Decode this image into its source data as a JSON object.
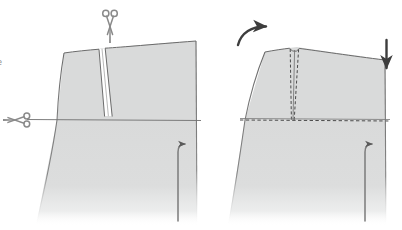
{
  "illustration": {
    "title": "Dart cutting and closing diagram",
    "description": "Two-step garment pattern illustration: left panel shows a skirt/trouser pattern block with an open V dart marked for cutting; right panel shows the same block with the dart stitched closed and arrows indicating fabric rotation and settling.",
    "background_color": "#ffffff",
    "fabric_fill_color": "#d9dada",
    "fabric_fill_color_light": "#e3e4e4",
    "outline_color": "#6b6b6b",
    "stitch_color": "#4a4a4a",
    "icon_color": "#8a8a8a",
    "arrow_color": "#3d3d3d"
  },
  "left_panel": {
    "name": "cut-step",
    "step_number": "1",
    "edge_label": "e",
    "elements": {
      "pattern_piece": "pattern-block-open-dart",
      "dart": "open-v-dart",
      "hip_line": "horizontal-hip-guide-line",
      "scissors_top": "scissors-icon-vertical",
      "scissors_left": "scissors-icon-horizontal",
      "side_seam_arrow": "hook-arrow-up-right"
    },
    "scissors_top_rotation_deg": "0",
    "scissors_left_rotation_deg": "90"
  },
  "right_panel": {
    "name": "sewn-step",
    "step_number": "2",
    "elements": {
      "pattern_piece": "pattern-block-closed-dart",
      "dart_stitch_left": "dart-stitch-line-left",
      "dart_stitch_right": "dart-stitch-line-right",
      "hip_line": "horizontal-hip-stitch-line",
      "rotate_arrow": "curved-arrow-rotate-up-right",
      "drop_arrow": "straight-arrow-down",
      "side_seam_arrow": "hook-arrow-up-right"
    }
  },
  "annotations": {
    "curved_arrow_direction": "up-right",
    "down_arrow_direction": "down",
    "hook_arrow_direction": "up-then-right"
  }
}
